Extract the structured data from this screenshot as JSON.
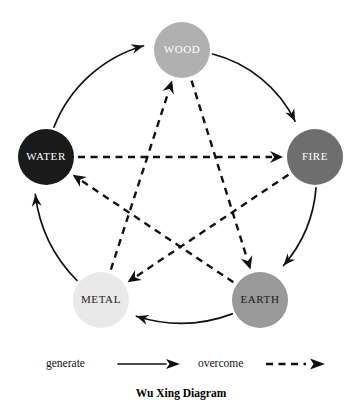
{
  "diagram": {
    "caption": "Wu Xing Diagram",
    "background_color": "#ffffff",
    "stroke_color": "#111111",
    "nodes": [
      {
        "id": "wood",
        "label": "WOOD",
        "cx": 182,
        "cy": 50,
        "r": 28,
        "fill": "#b0b0b0",
        "text_color": "#ffffff"
      },
      {
        "id": "fire",
        "label": "FIRE",
        "cx": 315,
        "cy": 157,
        "r": 28,
        "fill": "#6e6e6e",
        "text_color": "#ffffff"
      },
      {
        "id": "earth",
        "label": "EARTH",
        "cx": 260,
        "cy": 300,
        "r": 28,
        "fill": "#999999",
        "text_color": "#1a1a1a"
      },
      {
        "id": "metal",
        "label": "METAL",
        "cx": 101,
        "cy": 300,
        "r": 28,
        "fill": "#e9e9e9",
        "text_color": "#1a1a1a"
      },
      {
        "id": "water",
        "label": "WATER",
        "cx": 46,
        "cy": 157,
        "r": 28,
        "fill": "#1a1a1a",
        "text_color": "#ffffff"
      }
    ],
    "generate_cycle": [
      {
        "from": "wood",
        "to": "fire"
      },
      {
        "from": "fire",
        "to": "earth"
      },
      {
        "from": "earth",
        "to": "metal"
      },
      {
        "from": "metal",
        "to": "water"
      },
      {
        "from": "water",
        "to": "wood"
      }
    ],
    "overcome_cycle": [
      {
        "from": "wood",
        "to": "earth"
      },
      {
        "from": "earth",
        "to": "water"
      },
      {
        "from": "water",
        "to": "fire"
      },
      {
        "from": "fire",
        "to": "metal"
      },
      {
        "from": "metal",
        "to": "wood"
      }
    ]
  },
  "legend": {
    "generate_label": "generate",
    "overcome_label": "overcome"
  }
}
